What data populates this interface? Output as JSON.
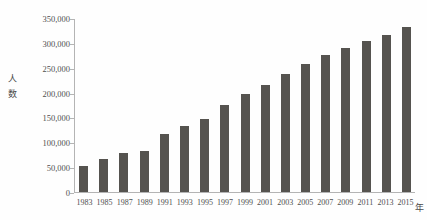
{
  "chart_data": {
    "type": "bar",
    "title": "",
    "xlabel": "年",
    "ylabel": "人数",
    "ylim": [
      0,
      350000
    ],
    "grid": false,
    "legend": "none",
    "y_ticks": [
      "0",
      "50,000",
      "100,000",
      "150,000",
      "200,000",
      "250,000",
      "300,000",
      "350,000"
    ],
    "y_tick_values": [
      0,
      50000,
      100000,
      150000,
      200000,
      250000,
      300000,
      350000
    ],
    "categories": [
      "1983",
      "1985",
      "1987",
      "1989",
      "1991",
      "1993",
      "1995",
      "1997",
      "1999",
      "2001",
      "2003",
      "2005",
      "2007",
      "2009",
      "2011",
      "2013",
      "2015"
    ],
    "values": [
      52000,
      67000,
      78000,
      82000,
      118000,
      133000,
      147000,
      176000,
      198000,
      216000,
      238000,
      259000,
      278000,
      291000,
      306000,
      318000,
      333000
    ],
    "bar_color": "#55534f",
    "axis_color": "#b4b4b4",
    "background": "#ffffff"
  }
}
